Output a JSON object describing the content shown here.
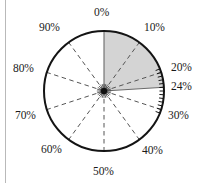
{
  "figure": {
    "name": "percentage-dial",
    "width": 208,
    "height": 183
  },
  "colors": {
    "outline": "#141414",
    "sector_fill": "#d4d4d4",
    "spoke_dashed": "#555555",
    "hub": "#101010",
    "label_text": "#1a1a1a",
    "page_background": "#ffffff",
    "left_rule": "#b9b9b9"
  },
  "chart_data": {
    "type": "pie",
    "title": "",
    "xlabel": "",
    "ylabel": "",
    "units": "%",
    "full_scale": 100,
    "start_angle_deg": 0,
    "direction": "clockwise",
    "center": {
      "x": 104,
      "y": 91
    },
    "radius": 60,
    "shaded_sector": {
      "label": "24%",
      "from": 0,
      "to": 24,
      "fill": "#d4d4d4"
    },
    "values": [
      24,
      76
    ],
    "categories": [
      "shaded",
      "unshaded"
    ],
    "spokes": [
      {
        "value": 0,
        "style": "solid"
      },
      {
        "value": 10,
        "style": "dashed"
      },
      {
        "value": 20,
        "style": "dashed"
      },
      {
        "value": 24,
        "style": "solid"
      },
      {
        "value": 30,
        "style": "dashed"
      },
      {
        "value": 40,
        "style": "dashed"
      },
      {
        "value": 50,
        "style": "dashed"
      },
      {
        "value": 60,
        "style": "dashed"
      },
      {
        "value": 70,
        "style": "dashed"
      },
      {
        "value": 80,
        "style": "dashed"
      },
      {
        "value": 90,
        "style": "dashed"
      }
    ],
    "tick_marks": {
      "from": 19,
      "to": 31,
      "step": 1
    },
    "labels": [
      {
        "id": "pct-0",
        "text": "0%",
        "value": 0,
        "x": 94,
        "y": 7
      },
      {
        "id": "pct-10",
        "text": "10%",
        "value": 10,
        "x": 144,
        "y": 22
      },
      {
        "id": "pct-20",
        "text": "20%",
        "value": 20,
        "x": 171,
        "y": 62
      },
      {
        "id": "pct-24",
        "text": "24%",
        "value": 24,
        "x": 171,
        "y": 81
      },
      {
        "id": "pct-30",
        "text": "30%",
        "value": 30,
        "x": 168,
        "y": 110
      },
      {
        "id": "pct-40",
        "text": "40%",
        "value": 40,
        "x": 142,
        "y": 145
      },
      {
        "id": "pct-50",
        "text": "50%",
        "value": 50,
        "x": 93,
        "y": 166
      },
      {
        "id": "pct-60",
        "text": "60%",
        "value": 60,
        "x": 41,
        "y": 144
      },
      {
        "id": "pct-70",
        "text": "70%",
        "value": 70,
        "x": 15,
        "y": 110
      },
      {
        "id": "pct-80",
        "text": "80%",
        "value": 80,
        "x": 13,
        "y": 63
      },
      {
        "id": "pct-90",
        "text": "90%",
        "value": 90,
        "x": 39,
        "y": 22
      }
    ]
  }
}
